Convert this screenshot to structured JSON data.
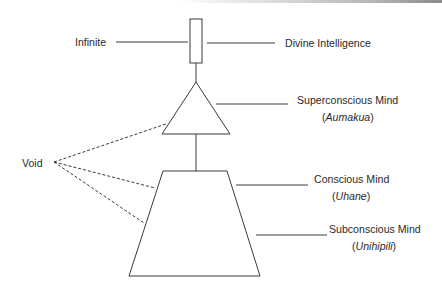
{
  "diagram": {
    "labels": {
      "infinite": "Infinite",
      "divine": "Divine Intelligence",
      "superconscious": {
        "title": "Superconscious Mind",
        "open": "(",
        "name": "Aumakua",
        "close": ")"
      },
      "void": "Void",
      "conscious": {
        "title": "Conscious Mind",
        "open": "(",
        "name": "Uhane",
        "close": ")"
      },
      "subconscious": {
        "title": "Subconscious Mind",
        "open": "(",
        "name": "Unihipili",
        "close": ")"
      }
    },
    "shapes": {
      "top": "rectangle",
      "middle": "triangle",
      "bottom": "trapezoid"
    },
    "colors": {
      "stroke": "#3a3a3a",
      "text": "#2a2a2a",
      "background": "#ffffff"
    }
  }
}
